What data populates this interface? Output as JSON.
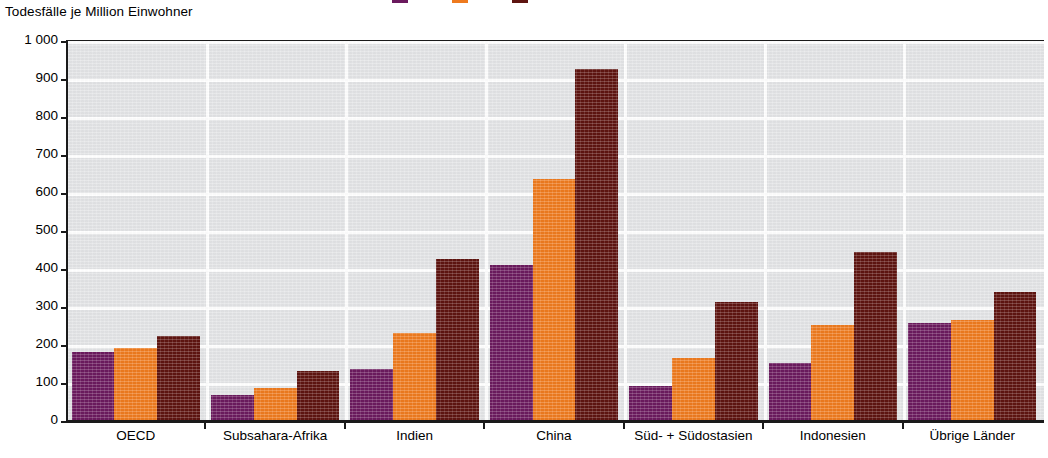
{
  "axis_title": "Todesfälle je Million Einwohner",
  "colors": {
    "series1_purple": "#6B1A5E",
    "series2_orange": "#EE7A1E",
    "series3_maroon": "#5E1410",
    "plot_background": "#E3E4E6",
    "gridline": "#FFFFFF",
    "axis": "#1A1A1A"
  },
  "chart_data": {
    "type": "bar",
    "title": "Todesfälle je Million Einwohner",
    "xlabel": "",
    "ylabel": "Todesfälle je Million Einwohner",
    "ylim": [
      0,
      1000
    ],
    "ytick_step": 100,
    "ytick_labels": [
      "1 000",
      "900",
      "800",
      "700",
      "600",
      "500",
      "400",
      "300",
      "200",
      "100",
      "0"
    ],
    "ytick_values": [
      1000,
      900,
      800,
      700,
      600,
      500,
      400,
      300,
      200,
      100,
      0
    ],
    "grid": true,
    "grid_axis": "both",
    "legend_position": "top-cropped",
    "categories": [
      "OECD",
      "Subsahara-Afrika",
      "Indien",
      "China",
      "Süd- + Südostasien",
      "Indonesien",
      "Übrige Länder"
    ],
    "series": [
      {
        "name": "series-1",
        "color": "#6B1A5E",
        "values": [
          180,
          65,
          133,
          407,
          90,
          150,
          256
        ]
      },
      {
        "name": "series-2",
        "color": "#EE7A1E",
        "values": [
          190,
          85,
          228,
          633,
          163,
          250,
          263
        ]
      },
      {
        "name": "series-3",
        "color": "#5E1410",
        "values": [
          222,
          130,
          425,
          925,
          310,
          443,
          336
        ]
      }
    ]
  }
}
